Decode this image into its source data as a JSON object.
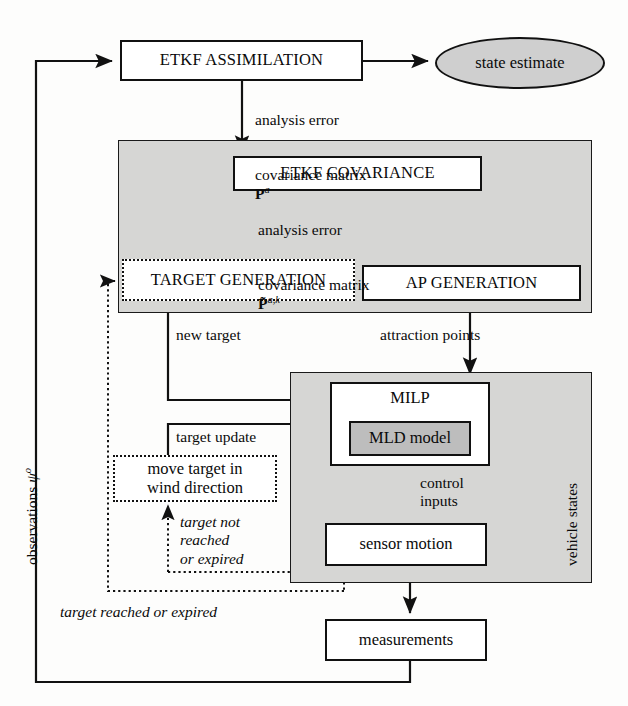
{
  "diagram": {
    "nodes": {
      "etkf_assimilation": "ETKF ASSIMILATION",
      "state_estimate": "state estimate",
      "etkf_covariance": "ETKF COVARIANCE",
      "target_generation": "TARGET GENERATION",
      "ap_generation": "AP GENERATION",
      "milp": "MILP",
      "mld_model": "MLD model",
      "move_target": "move target in\nwind direction",
      "sensor_motion": "sensor motion",
      "measurements": "measurements"
    },
    "edge_labels": {
      "analysis_error_1_line1": "analysis error",
      "analysis_error_1_line2": "covariance matrix",
      "analysis_error_1_symbol": "P",
      "analysis_error_1_superscript": "a",
      "analysis_error_2_line1": "analysis error",
      "analysis_error_2_line2": "covariance matrix",
      "analysis_error_2_symbol": "P̃",
      "analysis_error_2_superscript": "a,k",
      "new_target": "new target",
      "attraction_points": "attraction points",
      "target_update": "target update",
      "control_inputs": "control\ninputs",
      "target_not_reached": "target not\nreached\nor expired",
      "target_reached": "target reached or expired",
      "vehicle_states": "vehicle states",
      "observations": "observations",
      "observations_symbol": "ψ",
      "observations_superscript": "o"
    },
    "panels": {
      "estimation_panel": "estimation subsystem panel",
      "control_panel": "control subsystem panel"
    },
    "colors": {
      "panel_fill": "#d6d6d4",
      "node_fill": "#ffffff",
      "gray_node_fill": "#bdbdbd",
      "ellipse_fill": "#cfcfcf",
      "stroke": "#111111",
      "background": "#fdfdfc"
    }
  }
}
